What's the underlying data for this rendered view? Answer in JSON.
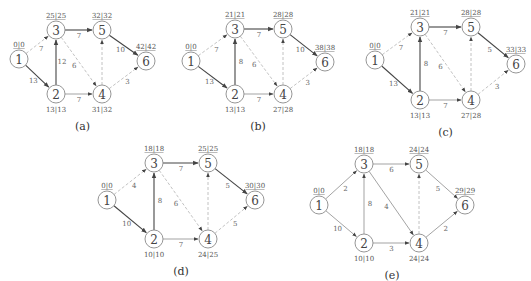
{
  "colors": {
    "critical": "#444444",
    "normal": "#999999",
    "dashed": "#bbbbbb",
    "node_stroke": "#8a8a8a"
  },
  "panels": [
    {
      "caption": "(a)",
      "offset": [
        0,
        0
      ],
      "nodes": [
        {
          "id": "1",
          "x": 19,
          "y": 59,
          "label": "0|0",
          "lpos": "top"
        },
        {
          "id": "2",
          "x": 56,
          "y": 94,
          "label": "13|13",
          "lpos": "bottom"
        },
        {
          "id": "3",
          "x": 56,
          "y": 30,
          "label": "25|25",
          "lpos": "top"
        },
        {
          "id": "4",
          "x": 102,
          "y": 94,
          "label": "31|32",
          "lpos": "bottom"
        },
        {
          "id": "5",
          "x": 102,
          "y": 30,
          "label": "32|32",
          "lpos": "top"
        },
        {
          "id": "6",
          "x": 146,
          "y": 61,
          "label": "42|42",
          "lpos": "top"
        }
      ],
      "edges": [
        {
          "from": "1",
          "to": "3",
          "w": "7",
          "style": "dash"
        },
        {
          "from": "1",
          "to": "2",
          "w": "13",
          "style": "crit"
        },
        {
          "from": "2",
          "to": "3",
          "w": "12",
          "style": "crit"
        },
        {
          "from": "2",
          "to": "4",
          "w": "7",
          "style": "norm"
        },
        {
          "from": "3",
          "to": "5",
          "w": "7",
          "style": "crit"
        },
        {
          "from": "3",
          "to": "4",
          "w": "6",
          "style": "dash"
        },
        {
          "from": "4",
          "to": "5",
          "w": "",
          "style": "dash"
        },
        {
          "from": "5",
          "to": "6",
          "w": "10",
          "style": "crit"
        },
        {
          "from": "4",
          "to": "6",
          "w": "3",
          "style": "dash"
        }
      ]
    },
    {
      "caption": "(b)",
      "offset": [
        175,
        0
      ],
      "nodes": [
        {
          "id": "1",
          "x": 16,
          "y": 61,
          "label": "0|0",
          "lpos": "top"
        },
        {
          "id": "2",
          "x": 60,
          "y": 94,
          "label": "13|13",
          "lpos": "bottom"
        },
        {
          "id": "3",
          "x": 60,
          "y": 29,
          "label": "21|21",
          "lpos": "top"
        },
        {
          "id": "4",
          "x": 108,
          "y": 94,
          "label": "27|28",
          "lpos": "bottom"
        },
        {
          "id": "5",
          "x": 108,
          "y": 29,
          "label": "28|28",
          "lpos": "top"
        },
        {
          "id": "6",
          "x": 150,
          "y": 62,
          "label": "38|38",
          "lpos": "top"
        }
      ],
      "edges": [
        {
          "from": "1",
          "to": "3",
          "w": "7",
          "style": "dash"
        },
        {
          "from": "1",
          "to": "2",
          "w": "13",
          "style": "crit"
        },
        {
          "from": "2",
          "to": "3",
          "w": "8",
          "style": "crit"
        },
        {
          "from": "2",
          "to": "4",
          "w": "7",
          "style": "norm"
        },
        {
          "from": "3",
          "to": "5",
          "w": "7",
          "style": "crit"
        },
        {
          "from": "3",
          "to": "4",
          "w": "6",
          "style": "dash"
        },
        {
          "from": "4",
          "to": "5",
          "w": "",
          "style": "dash"
        },
        {
          "from": "5",
          "to": "6",
          "w": "10",
          "style": "crit"
        },
        {
          "from": "4",
          "to": "6",
          "w": "3",
          "style": "dash"
        }
      ]
    },
    {
      "caption": "(c)",
      "offset": [
        350,
        0
      ],
      "nodes": [
        {
          "id": "1",
          "x": 25,
          "y": 60,
          "label": "0|0",
          "lpos": "top"
        },
        {
          "id": "2",
          "x": 70,
          "y": 100,
          "label": "13|13",
          "lpos": "bottom"
        },
        {
          "id": "3",
          "x": 70,
          "y": 27,
          "label": "21|21",
          "lpos": "top"
        },
        {
          "id": "4",
          "x": 121,
          "y": 100,
          "label": "27|28",
          "lpos": "bottom"
        },
        {
          "id": "5",
          "x": 121,
          "y": 27,
          "label": "28|28",
          "lpos": "top"
        },
        {
          "id": "6",
          "x": 166,
          "y": 64,
          "label": "33|33",
          "lpos": "top"
        }
      ],
      "edges": [
        {
          "from": "1",
          "to": "3",
          "w": "7",
          "style": "dash"
        },
        {
          "from": "1",
          "to": "2",
          "w": "13",
          "style": "crit"
        },
        {
          "from": "2",
          "to": "3",
          "w": "8",
          "style": "crit"
        },
        {
          "from": "2",
          "to": "4",
          "w": "7",
          "style": "norm"
        },
        {
          "from": "3",
          "to": "5",
          "w": "7",
          "style": "crit"
        },
        {
          "from": "3",
          "to": "4",
          "w": "6",
          "style": "dash"
        },
        {
          "from": "4",
          "to": "5",
          "w": "",
          "style": "dash"
        },
        {
          "from": "5",
          "to": "6",
          "w": "5",
          "style": "crit"
        },
        {
          "from": "4",
          "to": "6",
          "w": "3",
          "style": "dash"
        }
      ]
    },
    {
      "caption": "(d)",
      "offset": [
        80,
        135
      ],
      "nodes": [
        {
          "id": "1",
          "x": 27,
          "y": 65,
          "label": "0|0",
          "lpos": "top"
        },
        {
          "id": "2",
          "x": 74,
          "y": 104,
          "label": "10|10",
          "lpos": "bottom"
        },
        {
          "id": "3",
          "x": 74,
          "y": 28,
          "label": "18|18",
          "lpos": "top"
        },
        {
          "id": "4",
          "x": 128,
          "y": 104,
          "label": "24|25",
          "lpos": "bottom"
        },
        {
          "id": "5",
          "x": 128,
          "y": 28,
          "label": "25|25",
          "lpos": "top"
        },
        {
          "id": "6",
          "x": 175,
          "y": 65,
          "label": "30|30",
          "lpos": "top"
        }
      ],
      "edges": [
        {
          "from": "1",
          "to": "3",
          "w": "4",
          "style": "dash"
        },
        {
          "from": "1",
          "to": "2",
          "w": "10",
          "style": "crit"
        },
        {
          "from": "2",
          "to": "3",
          "w": "8",
          "style": "crit"
        },
        {
          "from": "2",
          "to": "4",
          "w": "7",
          "style": "norm"
        },
        {
          "from": "3",
          "to": "5",
          "w": "7",
          "style": "crit"
        },
        {
          "from": "3",
          "to": "4",
          "w": "6",
          "style": "dash"
        },
        {
          "from": "4",
          "to": "5",
          "w": "",
          "style": "dash"
        },
        {
          "from": "5",
          "to": "6",
          "w": "5",
          "style": "crit"
        },
        {
          "from": "4",
          "to": "6",
          "w": "5",
          "style": "dash"
        }
      ]
    },
    {
      "caption": "(e)",
      "offset": [
        290,
        135
      ],
      "nodes": [
        {
          "id": "1",
          "x": 29,
          "y": 70,
          "label": "0|0",
          "lpos": "top"
        },
        {
          "id": "2",
          "x": 74,
          "y": 108,
          "label": "10|10",
          "lpos": "bottom"
        },
        {
          "id": "3",
          "x": 74,
          "y": 29,
          "label": "18|18",
          "lpos": "top"
        },
        {
          "id": "4",
          "x": 129,
          "y": 108,
          "label": "24|24",
          "lpos": "bottom"
        },
        {
          "id": "5",
          "x": 129,
          "y": 29,
          "label": "24|24",
          "lpos": "top"
        },
        {
          "id": "6",
          "x": 175,
          "y": 70,
          "label": "29|29",
          "lpos": "top"
        }
      ],
      "edges": [
        {
          "from": "1",
          "to": "3",
          "w": "2",
          "style": "norm"
        },
        {
          "from": "1",
          "to": "2",
          "w": "10",
          "style": "norm"
        },
        {
          "from": "2",
          "to": "3",
          "w": "8",
          "style": "norm"
        },
        {
          "from": "2",
          "to": "4",
          "w": "3",
          "style": "norm"
        },
        {
          "from": "3",
          "to": "5",
          "w": "6",
          "style": "norm"
        },
        {
          "from": "3",
          "to": "4",
          "w": "4",
          "style": "norm"
        },
        {
          "from": "4",
          "to": "5",
          "w": "",
          "style": "dash"
        },
        {
          "from": "5",
          "to": "6",
          "w": "5",
          "style": "norm"
        },
        {
          "from": "4",
          "to": "6",
          "w": "2",
          "style": "norm"
        }
      ]
    }
  ]
}
